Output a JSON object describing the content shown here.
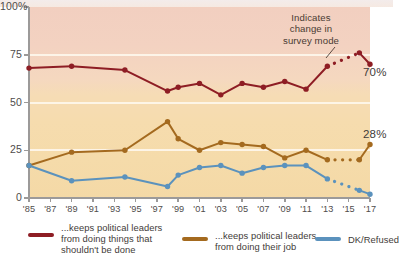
{
  "chart_data": {
    "type": "line",
    "title": "",
    "xlabel": "",
    "ylabel": "",
    "ylim": [
      0,
      100
    ],
    "ytick_labels": [
      "100%",
      "75",
      "50",
      "25",
      "0"
    ],
    "ytick_values": [
      100,
      75,
      50,
      25,
      0
    ],
    "grid": true,
    "gridline_values": [
      25,
      50,
      75
    ],
    "legend_position": "bottom",
    "x": [
      1985,
      1987,
      1989,
      1991,
      1994,
      1997,
      1998,
      1999,
      2001,
      2003,
      2005,
      2007,
      2009,
      2011,
      2013,
      2016,
      2017
    ],
    "xtick_labels": [
      "'85",
      "'87",
      "'89",
      "'91",
      "'93",
      "'95",
      "'97",
      "'99",
      "'01",
      "'03",
      "'05",
      "'07",
      "'09",
      "'11",
      "'13",
      "'15",
      "'17"
    ],
    "xtick_values": [
      1985,
      1987,
      1989,
      1991,
      1993,
      1995,
      1997,
      1999,
      2001,
      2003,
      2005,
      2007,
      2009,
      2011,
      2013,
      2015,
      2017
    ],
    "series": [
      {
        "name": "...keeps political leaders from doing things that shouldn't be done",
        "color": "#8e1d24",
        "end_label": "70%",
        "points": [
          {
            "x": 1985,
            "y": 68
          },
          {
            "x": 1989,
            "y": 69
          },
          {
            "x": 1994,
            "y": 67
          },
          {
            "x": 1998,
            "y": 56
          },
          {
            "x": 1999,
            "y": 58
          },
          {
            "x": 2001,
            "y": 60
          },
          {
            "x": 2003,
            "y": 54
          },
          {
            "x": 2005,
            "y": 60
          },
          {
            "x": 2007,
            "y": 58
          },
          {
            "x": 2009,
            "y": 61
          },
          {
            "x": 2011,
            "y": 57
          },
          {
            "x": 2013,
            "y": 69
          },
          {
            "x": 2016,
            "y": 76
          },
          {
            "x": 2017,
            "y": 70
          }
        ],
        "dashed_between": [
          2013,
          2016
        ]
      },
      {
        "name": "...keeps political leaders from doing their job",
        "color": "#a46a1f",
        "end_label": "28%",
        "points": [
          {
            "x": 1985,
            "y": 17
          },
          {
            "x": 1989,
            "y": 24
          },
          {
            "x": 1994,
            "y": 25
          },
          {
            "x": 1998,
            "y": 40
          },
          {
            "x": 1999,
            "y": 31
          },
          {
            "x": 2001,
            "y": 25
          },
          {
            "x": 2003,
            "y": 29
          },
          {
            "x": 2005,
            "y": 28
          },
          {
            "x": 2007,
            "y": 27
          },
          {
            "x": 2009,
            "y": 21
          },
          {
            "x": 2011,
            "y": 25
          },
          {
            "x": 2013,
            "y": 20
          },
          {
            "x": 2016,
            "y": 20
          },
          {
            "x": 2017,
            "y": 28
          }
        ],
        "dashed_between": [
          2013,
          2016
        ]
      },
      {
        "name": "DK/Refused",
        "color": "#5b92bd",
        "end_label": "",
        "points": [
          {
            "x": 1985,
            "y": 17
          },
          {
            "x": 1989,
            "y": 9
          },
          {
            "x": 1994,
            "y": 11
          },
          {
            "x": 1998,
            "y": 6
          },
          {
            "x": 1999,
            "y": 12
          },
          {
            "x": 2001,
            "y": 16
          },
          {
            "x": 2003,
            "y": 17
          },
          {
            "x": 2005,
            "y": 13
          },
          {
            "x": 2007,
            "y": 16
          },
          {
            "x": 2009,
            "y": 17
          },
          {
            "x": 2011,
            "y": 17
          },
          {
            "x": 2013,
            "y": 10
          },
          {
            "x": 2016,
            "y": 4
          },
          {
            "x": 2017,
            "y": 2
          }
        ],
        "dashed_between": [
          2013,
          2016
        ]
      }
    ],
    "annotations": [
      {
        "name": "survey-mode-note",
        "text": "Indicates change in survey mode"
      }
    ]
  },
  "annotation": {
    "line1": "Indicates",
    "line2": "change in",
    "line3": "survey mode"
  },
  "end_labels": {
    "red": "70%",
    "brown": "28%"
  },
  "legend": {
    "items": [
      {
        "label_line1": "...keeps political leaders",
        "label_line2": "from doing things that",
        "label_line3": "shouldn't be done",
        "color": "#8e1d24"
      },
      {
        "label_line1": "...keeps political leaders",
        "label_line2": "from doing their job",
        "label_line3": "",
        "color": "#a46a1f"
      },
      {
        "label_line1": "DK/Refused",
        "label_line2": "",
        "label_line3": "",
        "color": "#5b92bd"
      }
    ]
  }
}
